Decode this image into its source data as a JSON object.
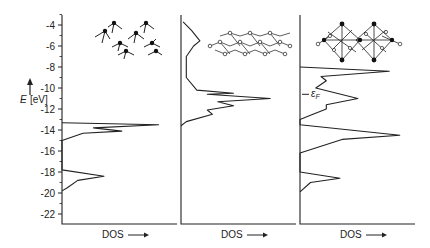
{
  "chart_data": {
    "type": "line",
    "title": "",
    "ylabel": "E [eV]",
    "ylim": [
      -23,
      -3.5
    ],
    "yticks": [
      -4,
      -6,
      -8,
      -10,
      -12,
      -14,
      -16,
      -18,
      -20,
      -22
    ],
    "ytick_labels": [
      "-4",
      "-6",
      "-8",
      "-10",
      "-12",
      "-14",
      "-16",
      "-18",
      "-20",
      "-22"
    ],
    "orientation": "DOS on horizontal axis, energy on vertical axis",
    "grid": false,
    "panels": [
      {
        "xlabel": "DOS",
        "xlabel_arrow": "→",
        "description": "Isolated molecules (molecular levels)",
        "series": [
          {
            "name": "DOS",
            "points": [
              {
                "E": -13.3,
                "dos": 0.0
              },
              {
                "E": -13.5,
                "dos": 0.92
              },
              {
                "E": -13.8,
                "dos": 0.3
              },
              {
                "E": -14.1,
                "dos": 0.57
              },
              {
                "E": -14.3,
                "dos": 0.2
              },
              {
                "E": -15.0,
                "dos": 0.0
              },
              {
                "E": -17.8,
                "dos": 0.0
              },
              {
                "E": -18.4,
                "dos": 0.4
              },
              {
                "E": -18.8,
                "dos": 0.15
              },
              {
                "E": -19.5,
                "dos": 0.05
              },
              {
                "E": -19.8,
                "dos": 0.0
              }
            ]
          }
        ]
      },
      {
        "xlabel": "DOS",
        "xlabel_arrow": "→",
        "description": "Layered chain structure",
        "series": [
          {
            "name": "DOS",
            "points": [
              {
                "E": -3.7,
                "dos": 0.02
              },
              {
                "E": -4.5,
                "dos": 0.1
              },
              {
                "E": -5.5,
                "dos": 0.18
              },
              {
                "E": -6.0,
                "dos": 0.12
              },
              {
                "E": -7.0,
                "dos": 0.05
              },
              {
                "E": -9.0,
                "dos": 0.05
              },
              {
                "E": -10.2,
                "dos": 0.15
              },
              {
                "E": -10.5,
                "dos": 0.5
              },
              {
                "E": -10.6,
                "dos": 0.25
              },
              {
                "E": -11.0,
                "dos": 0.85
              },
              {
                "E": -11.3,
                "dos": 0.35
              },
              {
                "E": -11.7,
                "dos": 0.5
              },
              {
                "E": -12.1,
                "dos": 0.25
              },
              {
                "E": -12.5,
                "dos": 0.3
              },
              {
                "E": -13.2,
                "dos": 0.05
              },
              {
                "E": -13.6,
                "dos": 0.0
              }
            ]
          }
        ]
      },
      {
        "xlabel": "DOS",
        "xlabel_arrow": "→",
        "description": "Three-dimensional octahedral network",
        "annotation": {
          "text": "εF",
          "E": -10.6
        },
        "series": [
          {
            "name": "DOS",
            "points": [
              {
                "E": -8.0,
                "dos": 0.0
              },
              {
                "E": -8.4,
                "dos": 0.85
              },
              {
                "E": -8.9,
                "dos": 0.2
              },
              {
                "E": -9.3,
                "dos": 0.25
              },
              {
                "E": -10.0,
                "dos": 0.15
              },
              {
                "E": -11.0,
                "dos": 0.55
              },
              {
                "E": -11.6,
                "dos": 0.25
              },
              {
                "E": -12.0,
                "dos": 0.25
              },
              {
                "E": -12.6,
                "dos": 0.1
              },
              {
                "E": -13.0,
                "dos": 0.0
              },
              {
                "E": -13.5,
                "dos": 0.0
              },
              {
                "E": -14.5,
                "dos": 0.95
              },
              {
                "E": -14.9,
                "dos": 0.4
              },
              {
                "E": -16.2,
                "dos": 0.0
              },
              {
                "E": -18.0,
                "dos": 0.0
              },
              {
                "E": -18.6,
                "dos": 0.38
              },
              {
                "E": -19.0,
                "dos": 0.1
              },
              {
                "E": -19.9,
                "dos": 0.0
              }
            ]
          }
        ]
      }
    ],
    "legend": null
  },
  "figure": {
    "y_axis_label_E": "E",
    "y_axis_label_unit": "[eV]",
    "fermi_label": "ε",
    "fermi_sub": "F",
    "panel_labels": [
      "DOS",
      "DOS",
      "DOS"
    ]
  }
}
